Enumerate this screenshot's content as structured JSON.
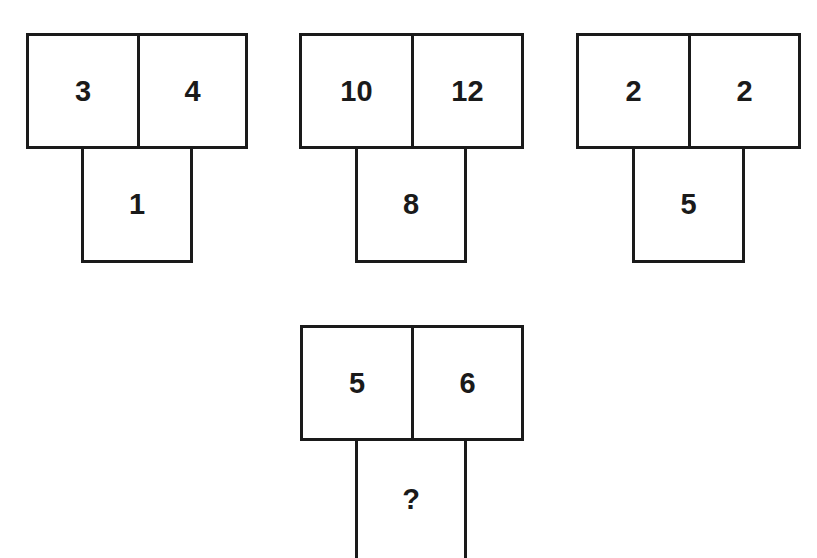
{
  "puzzle": {
    "figures": [
      {
        "top_left": "3",
        "top_right": "4",
        "bottom": "1"
      },
      {
        "top_left": "10",
        "top_right": "12",
        "bottom": "8"
      },
      {
        "top_left": "2",
        "top_right": "2",
        "bottom": "5"
      },
      {
        "top_left": "5",
        "top_right": "6",
        "bottom": "?"
      }
    ]
  }
}
